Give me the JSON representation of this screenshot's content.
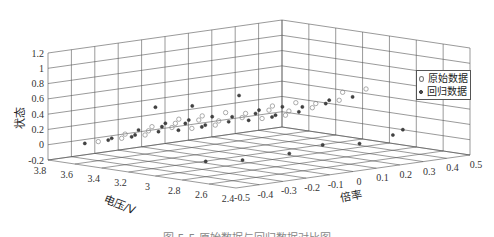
{
  "chart_data": {
    "type": "scatter",
    "projection": "3d",
    "title": "",
    "xlabel": "倍率",
    "ylabel": "电压/V",
    "zlabel": "状态",
    "x_ticks": [
      "-0.5",
      "-0.4",
      "-0.3",
      "-0.2",
      "-0.1",
      "0",
      "0.1",
      "0.2",
      "0.3",
      "0.4",
      "0.5"
    ],
    "y_ticks": [
      "3.8",
      "3.6",
      "3.4",
      "3.2",
      "3",
      "2.8",
      "2.6",
      "2.4"
    ],
    "z_ticks": [
      "1.2",
      "1",
      "0.8",
      "0.6",
      "0.4",
      "0.2",
      "0",
      "-0.2"
    ],
    "xlim": [
      -0.5,
      0.5
    ],
    "ylim": [
      2.4,
      3.8
    ],
    "zlim": [
      -0.2,
      1.2
    ],
    "grid": true,
    "legend_position": "upper right",
    "legend": [
      "原始数据",
      "回归数据"
    ],
    "series": [
      {
        "name": "原始数据",
        "marker": "open-circle",
        "description": "Discharge curves at multiple rates: state rises from ~0 to ~0.55 as voltage drops from ~3.6 V to ~2.8 V, arranged along the rate axis",
        "points": [
          {
            "x": -0.4,
            "y": 3.6,
            "z": 0.05
          },
          {
            "x": -0.4,
            "y": 3.4,
            "z": 0.2
          },
          {
            "x": -0.4,
            "y": 3.2,
            "z": 0.35
          },
          {
            "x": -0.4,
            "y": 3.0,
            "z": 0.5
          },
          {
            "x": -0.3,
            "y": 3.6,
            "z": 0.05
          },
          {
            "x": -0.3,
            "y": 3.4,
            "z": 0.2
          },
          {
            "x": -0.3,
            "y": 3.2,
            "z": 0.35
          },
          {
            "x": -0.3,
            "y": 3.0,
            "z": 0.5
          },
          {
            "x": -0.2,
            "y": 3.6,
            "z": 0.05
          },
          {
            "x": -0.2,
            "y": 3.4,
            "z": 0.2
          },
          {
            "x": -0.2,
            "y": 3.2,
            "z": 0.35
          },
          {
            "x": -0.2,
            "y": 3.0,
            "z": 0.5
          },
          {
            "x": 0.0,
            "y": 3.6,
            "z": 0.05
          },
          {
            "x": 0.0,
            "y": 3.4,
            "z": 0.2
          },
          {
            "x": 0.0,
            "y": 3.2,
            "z": 0.35
          },
          {
            "x": 0.0,
            "y": 3.0,
            "z": 0.5
          },
          {
            "x": 0.1,
            "y": 3.6,
            "z": 0.05
          },
          {
            "x": 0.1,
            "y": 3.4,
            "z": 0.2
          },
          {
            "x": 0.1,
            "y": 3.2,
            "z": 0.35
          },
          {
            "x": 0.1,
            "y": 3.0,
            "z": 0.5
          },
          {
            "x": 0.3,
            "y": 3.6,
            "z": 0.05
          },
          {
            "x": 0.3,
            "y": 3.4,
            "z": 0.2
          },
          {
            "x": 0.3,
            "y": 3.2,
            "z": 0.35
          },
          {
            "x": 0.3,
            "y": 3.0,
            "z": 0.55
          },
          {
            "x": 0.4,
            "y": 3.6,
            "z": 0.05
          },
          {
            "x": 0.4,
            "y": 3.4,
            "z": 0.2
          },
          {
            "x": 0.4,
            "y": 3.2,
            "z": 0.35
          },
          {
            "x": 0.4,
            "y": 3.0,
            "z": 0.55
          }
        ]
      },
      {
        "name": "回归数据",
        "marker": "filled-dot",
        "description": "Regression points overlaying the original curves, plus scattered points on the floor and a few outliers near z≈0.7",
        "points": [
          {
            "x": -0.4,
            "y": 3.7,
            "z": 0.0
          },
          {
            "x": -0.4,
            "y": 3.5,
            "z": 0.12
          },
          {
            "x": -0.4,
            "y": 3.3,
            "z": 0.28
          },
          {
            "x": -0.4,
            "y": 3.1,
            "z": 0.42
          },
          {
            "x": -0.3,
            "y": 3.7,
            "z": 0.0
          },
          {
            "x": -0.3,
            "y": 3.5,
            "z": 0.12
          },
          {
            "x": -0.3,
            "y": 3.3,
            "z": 0.28
          },
          {
            "x": -0.3,
            "y": 3.1,
            "z": 0.42
          },
          {
            "x": -0.2,
            "y": 3.7,
            "z": 0.0
          },
          {
            "x": -0.2,
            "y": 3.5,
            "z": 0.12
          },
          {
            "x": -0.2,
            "y": 3.3,
            "z": 0.28
          },
          {
            "x": -0.2,
            "y": 3.1,
            "z": 0.42
          },
          {
            "x": 0.0,
            "y": 3.7,
            "z": 0.0
          },
          {
            "x": 0.0,
            "y": 3.5,
            "z": 0.12
          },
          {
            "x": 0.0,
            "y": 3.3,
            "z": 0.28
          },
          {
            "x": 0.0,
            "y": 3.1,
            "z": 0.42
          },
          {
            "x": 0.1,
            "y": 3.7,
            "z": 0.0
          },
          {
            "x": 0.1,
            "y": 3.5,
            "z": 0.12
          },
          {
            "x": 0.1,
            "y": 3.3,
            "z": 0.28
          },
          {
            "x": 0.1,
            "y": 3.1,
            "z": 0.42
          },
          {
            "x": 0.3,
            "y": 3.7,
            "z": 0.0
          },
          {
            "x": 0.3,
            "y": 3.5,
            "z": 0.12
          },
          {
            "x": 0.3,
            "y": 3.3,
            "z": 0.28
          },
          {
            "x": 0.3,
            "y": 3.1,
            "z": 0.42
          },
          {
            "x": 0.4,
            "y": 3.7,
            "z": 0.0
          },
          {
            "x": 0.4,
            "y": 3.5,
            "z": 0.12
          },
          {
            "x": 0.4,
            "y": 3.3,
            "z": 0.28
          },
          {
            "x": 0.4,
            "y": 3.1,
            "z": 0.42
          },
          {
            "x": -0.5,
            "y": 3.0,
            "z": 0.7
          },
          {
            "x": -0.4,
            "y": 2.9,
            "z": 0.7
          },
          {
            "x": -0.2,
            "y": 2.9,
            "z": 0.75
          },
          {
            "x": -0.4,
            "y": 2.8,
            "z": 0.0
          },
          {
            "x": -0.3,
            "y": 2.7,
            "z": 0.0
          },
          {
            "x": -0.1,
            "y": 2.7,
            "z": 0.0
          },
          {
            "x": 0.1,
            "y": 2.8,
            "z": 0.0
          },
          {
            "x": 0.2,
            "y": 2.7,
            "z": 0.0
          },
          {
            "x": 0.4,
            "y": 2.8,
            "z": 0.0
          },
          {
            "x": 0.5,
            "y": 2.9,
            "z": 0.0
          }
        ]
      }
    ]
  },
  "axes": {
    "z_label": "状态",
    "y_label": "电压/V",
    "x_label": "倍率"
  },
  "legend": {
    "items": [
      {
        "label": "原始数据",
        "marker": "open-circle"
      },
      {
        "label": "回归数据",
        "marker": "filled-dot"
      }
    ]
  },
  "caption": "图 5-5  原始数据与回归数据对比图",
  "colors": {
    "grid": "#555555",
    "original_marker": "#888888",
    "regression_marker": "#444444"
  }
}
